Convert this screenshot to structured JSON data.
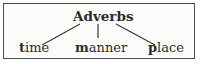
{
  "diagram": {
    "type": "tree",
    "root": {
      "label": "Adverbs"
    },
    "children": [
      {
        "first": "t",
        "rest": "ime",
        "label": "time"
      },
      {
        "first": "m",
        "rest": "anner",
        "label": "manner"
      },
      {
        "first": "p",
        "rest": "lace",
        "label": "place"
      }
    ],
    "colors": {
      "text": "#2b2b2b",
      "line": "#3a3a3a",
      "border": "#4a4a4a"
    }
  }
}
